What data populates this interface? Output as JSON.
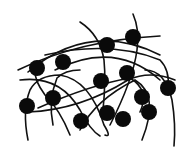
{
  "diagram": {
    "type": "network",
    "colors": {
      "background": "#ffffff",
      "strand": "#111111",
      "node": "#0a0a0a"
    },
    "node_radius": 8,
    "nodes": [
      {
        "id": "A",
        "x": 37,
        "y": 68
      },
      {
        "id": "B",
        "x": 63,
        "y": 62
      },
      {
        "id": "C",
        "x": 107,
        "y": 45
      },
      {
        "id": "D",
        "x": 133,
        "y": 37
      },
      {
        "id": "E",
        "x": 27,
        "y": 106
      },
      {
        "id": "F",
        "x": 53,
        "y": 98
      },
      {
        "id": "G",
        "x": 101,
        "y": 81
      },
      {
        "id": "H",
        "x": 127,
        "y": 73
      },
      {
        "id": "I",
        "x": 168,
        "y": 88
      },
      {
        "id": "J",
        "x": 142,
        "y": 97
      },
      {
        "id": "K",
        "x": 81,
        "y": 121
      },
      {
        "id": "L",
        "x": 107,
        "y": 113
      },
      {
        "id": "M",
        "x": 123,
        "y": 119
      },
      {
        "id": "N",
        "x": 149,
        "y": 112
      }
    ],
    "strands": [
      "M 18 70 Q 80 40 160 36",
      "M 28 72 Q 90 20 160 55",
      "M 45 55 Q 110 40 160 60 Q 170 70 168 88",
      "M 80 22 Q 100 35 104 60 Q 106 80 103 110",
      "M 133 14 Q 140 30 137 50 Q 133 80 110 125",
      "M 55 70 Q 115 40 160 80",
      "M 28 140 Q 22 110 30 90 Q 38 75 60 75 Q 90 80 104 125 Q 112 138 105 135",
      "M 53 125 Q 48 100 57 78 Q 65 70 80 70",
      "M 28 112 Q 80 110 128 80 Q 150 70 175 80",
      "M 70 135 Q 60 110 45 95 Q 34 80 35 70",
      "M 80 130 Q 95 100 135 80 Q 160 95 142 140",
      "M 145 70 Q 165 70 172 100 Q 176 125 174 146",
      "M 20 80 Q 60 75 80 110 Q 90 130 100 136",
      "M 38 108 Q 90 85 130 78 Q 150 90 140 112"
    ]
  }
}
